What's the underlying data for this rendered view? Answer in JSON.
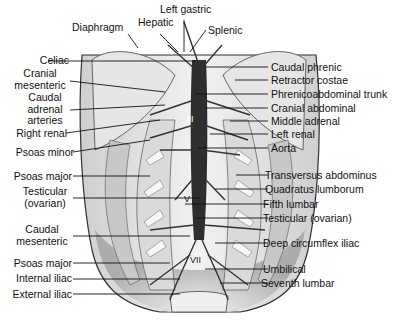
{
  "figure": {
    "top_labels": [
      {
        "id": "diaphragm",
        "text": "Diaphragm"
      },
      {
        "id": "hepatic",
        "text": "Hepatic"
      },
      {
        "id": "left_gastric",
        "text": "Left gastric"
      },
      {
        "id": "splenic",
        "text": "Splenic"
      }
    ],
    "left_labels": [
      {
        "id": "celiac",
        "text": "Celiac"
      },
      {
        "id": "cranial_mesenteric",
        "line1": "Cranial",
        "line2": "mesenteric"
      },
      {
        "id": "caudal_adrenal",
        "line1": "Caudal",
        "line2": "adrenal",
        "line3": "arteries"
      },
      {
        "id": "right_renal",
        "text": "Right renal"
      },
      {
        "id": "psoas_minor",
        "text": "Psoas minor"
      },
      {
        "id": "psoas_major_1",
        "text": "Psoas major"
      },
      {
        "id": "testicular_left",
        "line1": "Testicular",
        "line2": "(ovarian)"
      },
      {
        "id": "caudal_mesenteric",
        "line1": "Caudal",
        "line2": "mesenteric"
      },
      {
        "id": "psoas_major_2",
        "text": "Psoas major"
      },
      {
        "id": "internal_iliac",
        "text": "Internal iliac"
      },
      {
        "id": "external_iliac",
        "text": "External iliac"
      }
    ],
    "right_labels": [
      {
        "id": "caudal_phrenic",
        "text": "Caudal phrenic"
      },
      {
        "id": "retractor_costae",
        "text": "Retractor costae"
      },
      {
        "id": "phrenicoabdominal_trunk",
        "text": "Phrenicoabdominal trunk"
      },
      {
        "id": "cranial_abdominal",
        "text": "Cranial abdominal"
      },
      {
        "id": "middle_adrenal",
        "text": "Middle adrenal"
      },
      {
        "id": "left_renal",
        "text": "Left renal"
      },
      {
        "id": "aorta",
        "text": "Aorta"
      },
      {
        "id": "transversus_abdominus",
        "text": "Transversus abdominus"
      },
      {
        "id": "quadratus_lumborum",
        "text": "Quadratus lumborum"
      },
      {
        "id": "fifth_lumbar",
        "text": "Fifth lumbar"
      },
      {
        "id": "testicular_right",
        "text": "Testicular (ovarian)"
      },
      {
        "id": "deep_circumflex_iliac",
        "text": "Deep circumflex iliac"
      },
      {
        "id": "umbilical",
        "text": "Umbilical"
      },
      {
        "id": "seventh_lumbar",
        "text": "Seventh lumbar"
      }
    ],
    "vertebra_markers": [
      "III",
      "V",
      "VII"
    ]
  }
}
